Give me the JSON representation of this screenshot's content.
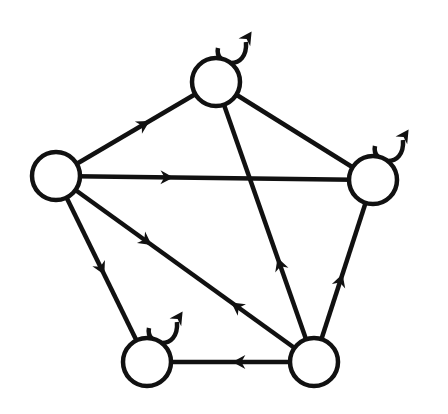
{
  "diagram": {
    "type": "directed-graph",
    "stroke_color": "#111111",
    "fill_color": "#ffffff",
    "node_radius": 24,
    "nodes": [
      {
        "id": "top",
        "x": 216,
        "y": 82,
        "self_loop": true
      },
      {
        "id": "left",
        "x": 56,
        "y": 176,
        "self_loop": false
      },
      {
        "id": "right",
        "x": 373,
        "y": 180,
        "self_loop": true
      },
      {
        "id": "bottom-left",
        "x": 147,
        "y": 362,
        "self_loop": true
      },
      {
        "id": "bottom-right",
        "x": 314,
        "y": 362,
        "self_loop": false
      }
    ],
    "edges": [
      {
        "from": "left",
        "to": "top",
        "arrow_at": 0.55,
        "directed": true
      },
      {
        "from": "left",
        "to": "right",
        "arrow_at": 0.35,
        "directed": true
      },
      {
        "from": "left",
        "to": "bottom-left",
        "arrow_at": 0.5,
        "directed": true
      },
      {
        "from": "left",
        "to": "bottom-right",
        "arrow_at": 0.35,
        "directed": true
      },
      {
        "from": "bottom-right",
        "to": "left",
        "arrow_at": 0.3,
        "directed": true
      },
      {
        "from": "bottom-right",
        "to": "top",
        "arrow_at": 0.35,
        "directed": true
      },
      {
        "from": "bottom-right",
        "to": "right",
        "arrow_at": 0.45,
        "directed": true
      },
      {
        "from": "bottom-right",
        "to": "bottom-left",
        "arrow_at": 0.45,
        "directed": true
      },
      {
        "from": "top",
        "to": "right",
        "directed": false
      }
    ]
  }
}
